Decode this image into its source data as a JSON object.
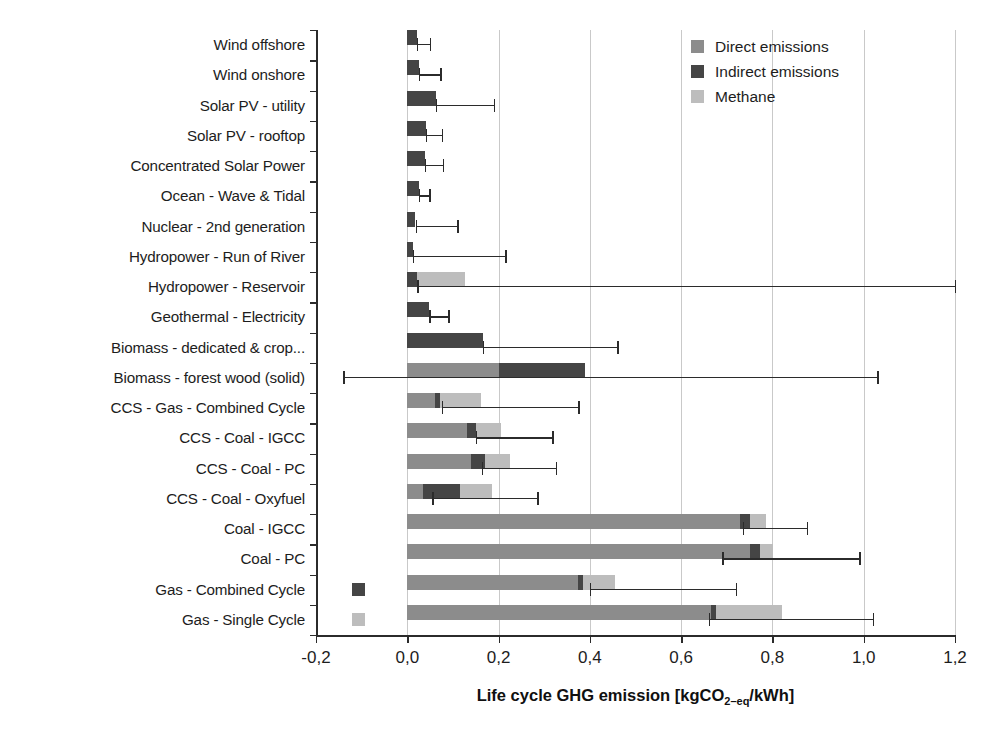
{
  "chart_data": {
    "type": "bar",
    "orientation": "horizontal",
    "stacked": true,
    "title": "",
    "xlabel": "Life cycle GHG emission [kgCO2-eq/kWh]",
    "xlabel_parts": {
      "before": "Life cycle GHG emission [kgCO",
      "sub": "2–eq",
      "after": "/kWh]"
    },
    "ylabel": "",
    "xlim": [
      -0.2,
      1.2
    ],
    "xticks": [
      -0.2,
      0.0,
      0.2,
      0.4,
      0.6,
      0.8,
      1.0,
      1.2
    ],
    "xticklabels": [
      "-0,2",
      "0,0",
      "0,2",
      "0,4",
      "0,6",
      "0,8",
      "1,0",
      "1,2"
    ],
    "grid": "vertical",
    "legend_position": "top-right",
    "decimal_separator": ",",
    "series": [
      {
        "name": "Direct emissions",
        "color": "#8c8c8c",
        "values": [
          0.0,
          0.0,
          0.0,
          0.0,
          0.0,
          0.0,
          0.0,
          0.0,
          0.0,
          0.0,
          0.0,
          0.2,
          0.06,
          0.13,
          0.14,
          0.035,
          0.73,
          0.75,
          0.375,
          0.665
        ]
      },
      {
        "name": "Indirect emissions",
        "color": "#454545",
        "values": [
          0.022,
          0.025,
          0.062,
          0.04,
          0.038,
          0.025,
          0.018,
          0.012,
          0.022,
          0.048,
          0.165,
          0.19,
          0.012,
          0.02,
          0.03,
          0.08,
          0.02,
          0.022,
          0.01,
          0.012
        ]
      },
      {
        "name": "Methane",
        "color": "#bdbdbd",
        "values": [
          0.0,
          0.0,
          0.0,
          0.0,
          0.0,
          0.0,
          0.0,
          0.0,
          0.105,
          0.0,
          0.0,
          0.0,
          0.09,
          0.055,
          0.055,
          0.07,
          0.035,
          0.03,
          0.07,
          0.145
        ]
      }
    ],
    "categories": [
      "Wind offshore",
      "Wind onshore",
      "Solar PV - utility",
      "Solar PV - rooftop",
      "Concentrated Solar Power",
      "Ocean - Wave & Tidal",
      "Nuclear - 2nd generation",
      "Hydropower - Run of River",
      "Hydropower - Reservoir",
      "Geothermal - Electricity",
      "Biomass - dedicated & crop...",
      "Biomass - forest wood (solid)",
      "CCS - Gas - Combined Cycle",
      "CCS - Coal - IGCC",
      "CCS - Coal - PC",
      "CCS - Coal - Oxyfuel",
      "Coal - IGCC",
      "Coal - PC",
      "Gas - Combined Cycle",
      "Gas - Single Cycle"
    ],
    "error_bars": [
      {
        "category": "Wind offshore",
        "low": 0.021,
        "high": 0.05
      },
      {
        "category": "Wind onshore",
        "low": 0.025,
        "high": 0.072
      },
      {
        "category": "Solar PV - utility",
        "low": 0.062,
        "high": 0.19
      },
      {
        "category": "Solar PV - rooftop",
        "low": 0.04,
        "high": 0.075
      },
      {
        "category": "Concentrated Solar Power",
        "low": 0.038,
        "high": 0.078
      },
      {
        "category": "Ocean - Wave & Tidal",
        "low": 0.025,
        "high": 0.048
      },
      {
        "category": "Nuclear - 2nd generation",
        "low": 0.018,
        "high": 0.11
      },
      {
        "category": "Hydropower - Run of River",
        "low": 0.012,
        "high": 0.215
      },
      {
        "category": "Hydropower - Reservoir",
        "low": 0.022,
        "high": 1.2
      },
      {
        "category": "Geothermal - Electricity",
        "low": 0.048,
        "high": 0.09
      },
      {
        "category": "Biomass - dedicated & crop...",
        "low": 0.165,
        "high": 0.46
      },
      {
        "category": "Biomass - forest wood (solid)",
        "low": -0.14,
        "high": 1.03
      },
      {
        "category": "CCS - Gas - Combined Cycle",
        "low": 0.075,
        "high": 0.375
      },
      {
        "category": "CCS - Coal - IGCC",
        "low": 0.15,
        "high": 0.318
      },
      {
        "category": "CCS - Coal - PC",
        "low": 0.163,
        "high": 0.325
      },
      {
        "category": "CCS - Coal - Oxyfuel",
        "low": 0.055,
        "high": 0.285
      },
      {
        "category": "Coal - IGCC",
        "low": 0.735,
        "high": 0.875
      },
      {
        "category": "Coal - PC",
        "low": 0.69,
        "high": 0.99
      },
      {
        "category": "Gas - Combined Cycle",
        "low": 0.4,
        "high": 0.72
      },
      {
        "category": "Gas - Single Cycle",
        "low": 0.66,
        "high": 1.02
      }
    ],
    "offscale_markers": [
      {
        "category": "Gas - Combined Cycle",
        "series": "Indirect emissions",
        "x": -0.122
      },
      {
        "category": "Gas - Single Cycle",
        "series": "Methane",
        "x": -0.122
      }
    ]
  },
  "legend": {
    "items": [
      {
        "label": "Direct emissions",
        "color": "#8c8c8c",
        "key": "direct"
      },
      {
        "label": "Indirect emissions",
        "color": "#454545",
        "key": "indirect"
      },
      {
        "label": "Methane",
        "color": "#bdbdbd",
        "key": "methane"
      }
    ]
  }
}
